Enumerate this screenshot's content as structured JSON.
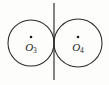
{
  "figure": {
    "background_color": "#fdfdfc",
    "stroke_color": "#2b2b2b",
    "label_color": "#1f1f1f",
    "width": 109,
    "height": 85
  },
  "circles": [
    {
      "id": "left",
      "center_label_letter": "O",
      "center_label_subscript": "3",
      "center_label_full": "O3",
      "cx": 31,
      "cy": 43,
      "r": 23,
      "dot_cx": 31,
      "dot_cy": 37,
      "dot_r": 1.3,
      "label_x": 31,
      "label_y": 51
    },
    {
      "id": "right",
      "center_label_letter": "O",
      "center_label_subscript": "4",
      "center_label_full": "O4",
      "cx": 78,
      "cy": 43,
      "r": 24,
      "dot_cx": 78,
      "dot_cy": 37,
      "dot_r": 1.3,
      "label_x": 78,
      "label_y": 51
    }
  ],
  "tangent_line": {
    "name": "common-tangent",
    "x": 54,
    "y_top": 3,
    "y_bottom": 80
  },
  "tangency_point": {
    "x": 54,
    "y": 43
  },
  "caption_fragment": {
    "text": "",
    "x": 54,
    "y": 84
  }
}
